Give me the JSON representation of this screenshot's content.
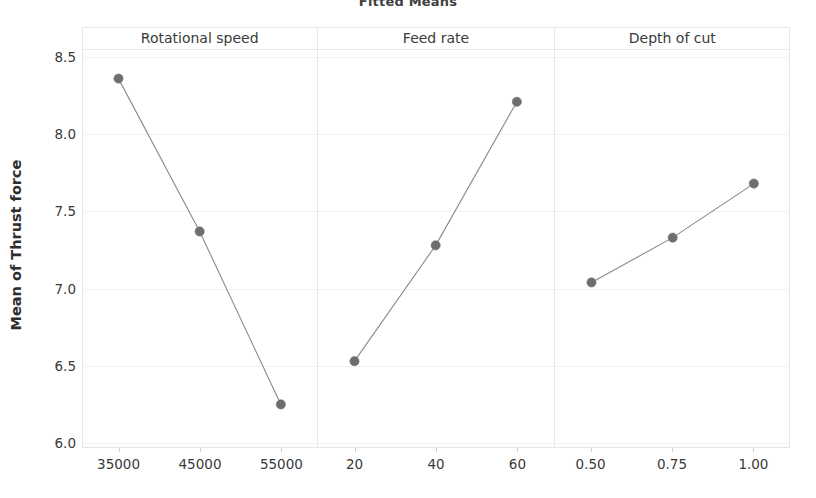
{
  "chart_data": {
    "type": "line",
    "title": "Fitted Means",
    "ylabel": "Mean of Thrust force",
    "xlabel": "",
    "ylim": [
      6.0,
      8.5
    ],
    "yticks": [
      "8.5",
      "8.0",
      "7.5",
      "7.0",
      "6.5",
      "6.0"
    ],
    "ytick_values": [
      8.5,
      8.0,
      7.5,
      7.0,
      6.5,
      6.0
    ],
    "grid": true,
    "legend": "none",
    "marker_color": "#6e6e6e",
    "line_color": "#8a8a8a",
    "panels": [
      {
        "name": "Rotational speed",
        "categories": [
          "35000",
          "45000",
          "55000"
        ],
        "values": [
          8.36,
          7.37,
          6.25
        ]
      },
      {
        "name": "Feed rate",
        "categories": [
          "20",
          "40",
          "60"
        ],
        "values": [
          6.53,
          7.28,
          8.21
        ]
      },
      {
        "name": "Depth of cut",
        "categories": [
          "0.50",
          "0.75",
          "1.00"
        ],
        "values": [
          7.04,
          7.33,
          7.68
        ]
      }
    ]
  }
}
